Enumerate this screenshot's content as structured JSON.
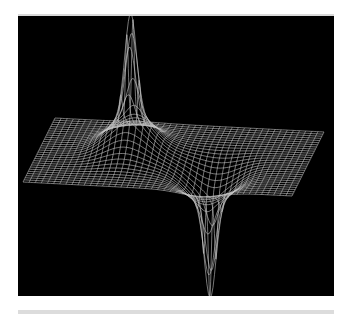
{
  "chart_data": {
    "type": "surface-wireframe",
    "title": "",
    "xlabel": "",
    "ylabel": "",
    "zlabel": "",
    "background": "#000000",
    "line_color": "#c8c8c8",
    "grid": {
      "cols": 44,
      "rows": 30
    },
    "projection": {
      "origin": [
        23,
        182
      ],
      "u_vector": [
        269,
        14
      ],
      "v_vector": [
        32,
        -64
      ],
      "z_scale_px": 1
    },
    "features": [
      {
        "name": "peak",
        "center": [
          0.333,
          0.57
        ],
        "broad_height": 38,
        "broad_width": 0.012,
        "spike_height": 100,
        "spike_width": 0.0009
      },
      {
        "name": "trough",
        "center": [
          0.66,
          0.3
        ],
        "broad_height": -34,
        "broad_width": 0.012,
        "spike_height": -92,
        "spike_width": 0.0009
      }
    ],
    "annotations": [],
    "legend": null
  }
}
